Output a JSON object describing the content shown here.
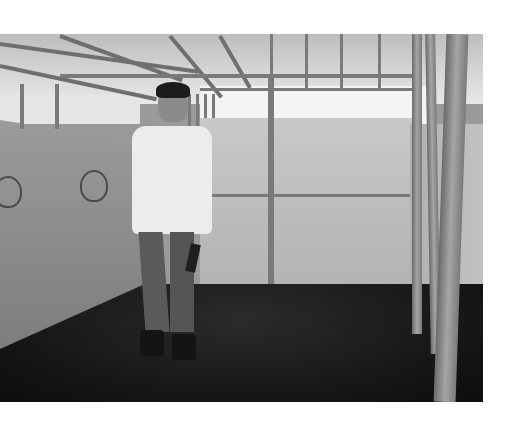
{
  "image": {
    "description": "Grayscale photo of a young man in a white sweatshirt and jeans holding a notebook, standing inside a bamboo-framed shelter with tarpaulin walls and a dark earthen floor",
    "palette": {
      "tarp": "#bdbdbd",
      "floor": "#151515",
      "shirt": "#ececec",
      "bamboo": "#8a8a8a",
      "background": "#ffffff"
    },
    "bounds": {
      "x": 0,
      "y": 34,
      "width": 483,
      "height": 368
    }
  }
}
